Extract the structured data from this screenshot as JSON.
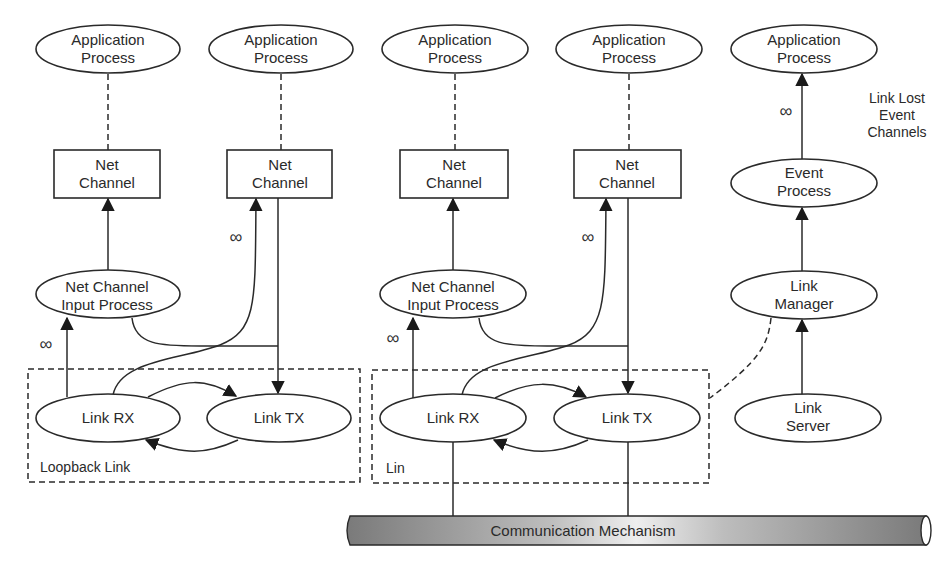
{
  "diagram": {
    "nodes": {
      "app1": {
        "line1": "Application",
        "line2": "Process"
      },
      "app2": {
        "line1": "Application",
        "line2": "Process"
      },
      "app3": {
        "line1": "Application",
        "line2": "Process"
      },
      "app4": {
        "line1": "Application",
        "line2": "Process"
      },
      "app5": {
        "line1": "Application",
        "line2": "Process"
      },
      "nc1": {
        "line1": "Net",
        "line2": "Channel"
      },
      "nc2": {
        "line1": "Net",
        "line2": "Channel"
      },
      "nc3": {
        "line1": "Net",
        "line2": "Channel"
      },
      "nc4": {
        "line1": "Net",
        "line2": "Channel"
      },
      "ncip1": {
        "line1": "Net Channel",
        "line2": "Input Process"
      },
      "ncip2": {
        "line1": "Net Channel",
        "line2": "Input Process"
      },
      "rx1": {
        "label": "Link RX"
      },
      "tx1": {
        "label": "Link TX"
      },
      "rx2": {
        "label": "Link RX"
      },
      "tx2": {
        "label": "Link TX"
      },
      "event": {
        "line1": "Event",
        "line2": "Process"
      },
      "manager": {
        "line1": "Link",
        "line2": "Manager"
      },
      "server": {
        "line1": "Link",
        "line2": "Server"
      }
    },
    "groups": {
      "loopback": "Loopback Link",
      "lin": "Lin"
    },
    "annotations": {
      "infinity": "∞",
      "link_lost_line1": "Link Lost",
      "link_lost_line2": "Event",
      "link_lost_line3": "Channels"
    },
    "bus": {
      "label": "Communication Mechanism"
    }
  }
}
